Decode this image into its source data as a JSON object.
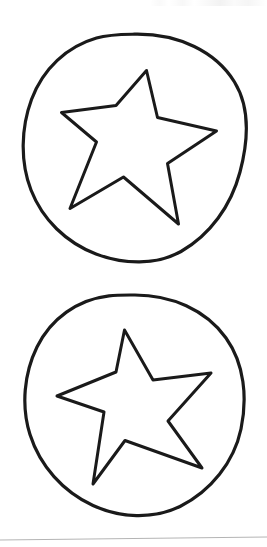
{
  "document": {
    "title": "Star Stencil Sheet",
    "background_color": "#ffffff",
    "ink_color": "#1a1a1a",
    "rule_color": "#b4b4b4",
    "width": 267,
    "height": 547,
    "description": "Scanned black-and-white line-art worksheet showing two hand-drawn five-pointed stars, each enclosed in a hand-drawn circle."
  },
  "figures": [
    {
      "id": "figure-one",
      "label": "Star in circle, upper",
      "circle": {
        "center_x": 134,
        "center_y": 148,
        "radius_x": 111,
        "radius_y": 114,
        "rotation_deg": -4,
        "stroke_width": 3.2
      },
      "star": {
        "points": 5,
        "rotation_deg": -14,
        "stroke_width": 3.0,
        "outer_points": [
          {
            "x": 147,
            "y": 71
          },
          {
            "x": 217,
            "y": 132
          },
          {
            "x": 178,
            "y": 224
          },
          {
            "x": 70,
            "y": 208
          },
          {
            "x": 62,
            "y": 113
          }
        ],
        "inner_points": [
          {
            "x": 157,
            "y": 118
          },
          {
            "x": 168,
            "y": 163
          },
          {
            "x": 124,
            "y": 177
          },
          {
            "x": 97,
            "y": 142
          },
          {
            "x": 116,
            "y": 105
          }
        ]
      }
    },
    {
      "id": "figure-two",
      "label": "Star in circle, lower",
      "circle": {
        "center_x": 136,
        "center_y": 407,
        "radius_x": 110,
        "radius_y": 112,
        "rotation_deg": 3,
        "stroke_width": 3.2
      },
      "star": {
        "points": 5,
        "rotation_deg": -8,
        "stroke_width": 3.0,
        "outer_points": [
          {
            "x": 125,
            "y": 330
          },
          {
            "x": 211,
            "y": 373
          },
          {
            "x": 202,
            "y": 468
          },
          {
            "x": 93,
            "y": 484
          },
          {
            "x": 57,
            "y": 396
          }
        ],
        "inner_points": [
          {
            "x": 153,
            "y": 380
          },
          {
            "x": 168,
            "y": 421
          },
          {
            "x": 125,
            "y": 440
          },
          {
            "x": 104,
            "y": 412
          },
          {
            "x": 116,
            "y": 372
          }
        ]
      }
    }
  ],
  "footer_rule": {
    "label": "page edge rule",
    "y_left": 540,
    "y_right": 537,
    "color": "#b4b4b4",
    "stroke_width": 1
  }
}
